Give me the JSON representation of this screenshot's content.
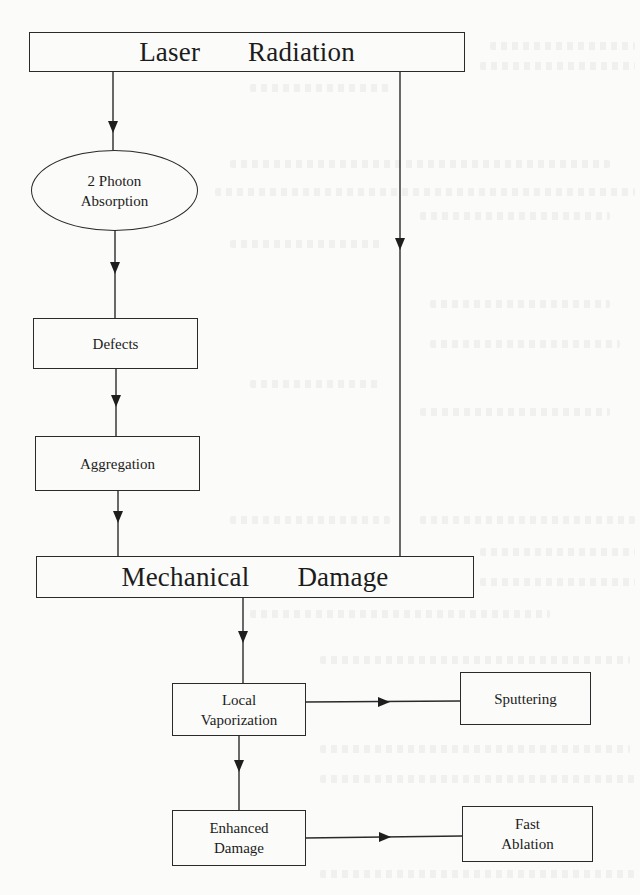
{
  "diagram": {
    "title": "",
    "nodes": {
      "laser_radiation": {
        "words": [
          "Laser",
          "Radiation"
        ]
      },
      "two_photon_absorption": {
        "lines": [
          "2 Photon",
          "Absorption"
        ]
      },
      "defects": {
        "label": "Defects"
      },
      "aggregation": {
        "label": "Aggregation"
      },
      "mechanical_damage": {
        "words": [
          "Mechanical",
          "Damage"
        ]
      },
      "local_vaporization": {
        "lines": [
          "Local",
          "Vaporization"
        ]
      },
      "sputtering": {
        "label": "Sputtering"
      },
      "enhanced_damage": {
        "lines": [
          "Enhanced",
          "Damage"
        ]
      },
      "fast_ablation": {
        "lines": [
          "Fast",
          "Ablation"
        ]
      }
    },
    "edges": [
      {
        "from": "Laser Radiation",
        "to": "2 Photon Absorption"
      },
      {
        "from": "Laser Radiation",
        "to": "Mechanical Damage"
      },
      {
        "from": "2 Photon Absorption",
        "to": "Defects"
      },
      {
        "from": "Defects",
        "to": "Aggregation"
      },
      {
        "from": "Aggregation",
        "to": "Mechanical Damage"
      },
      {
        "from": "Mechanical Damage",
        "to": "Local Vaporization"
      },
      {
        "from": "Local Vaporization",
        "to": "Sputtering"
      },
      {
        "from": "Local Vaporization",
        "to": "Enhanced Damage"
      },
      {
        "from": "Enhanced Damage",
        "to": "Fast Ablation"
      }
    ],
    "colors": {
      "line": "#2a2a2a",
      "background": "#fbfbf9"
    }
  }
}
